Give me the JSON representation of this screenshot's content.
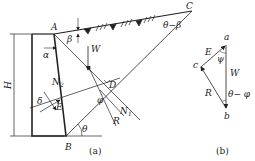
{
  "figure_a": {
    "caption": "(a)",
    "points": {
      "A": "A",
      "B": "B",
      "C": "C",
      "D": "D"
    },
    "angles": {
      "alpha": "α",
      "beta": "β",
      "theta": "θ",
      "delta": "δ",
      "phi": "φ",
      "theta_minus_beta": "θ−β"
    },
    "forces": {
      "W": "W",
      "E": "E",
      "N2": "N",
      "N2_sub": "2",
      "N1": "N",
      "N1_sub": "1",
      "R": "R"
    },
    "height_label": "H"
  },
  "figure_b": {
    "caption": "(b)",
    "vertices": {
      "a": "a",
      "b": "b",
      "c": "c"
    },
    "sides": {
      "E": "E",
      "W": "W",
      "R": "R"
    },
    "angles": {
      "psi": "ψ",
      "theta_minus_phi": "θ− φ"
    }
  },
  "colors": {
    "line": "#222222",
    "background": "#ffffff"
  }
}
